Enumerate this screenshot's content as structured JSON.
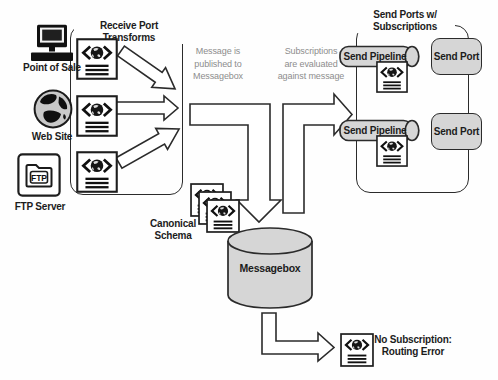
{
  "sources": [
    {
      "label": "Point of Sale"
    },
    {
      "label": "Web Site"
    },
    {
      "label": "FTP Server",
      "icon_text": "FTP"
    }
  ],
  "receive_group": {
    "title": "Receive Port Transforms"
  },
  "flow_notes": {
    "publish": "Message is\npublished to\nMessagebox",
    "subscriptions": "Subscriptions\nare evaluated\nagainst message"
  },
  "canonical_schema": {
    "label": "Canonical\nSchema"
  },
  "messagebox": {
    "label": "Messagebox"
  },
  "send_group": {
    "title": "Send Ports w/\nSubscriptions",
    "pipelines": [
      "Send Pipeline",
      "Send Pipeline"
    ],
    "ports": [
      "Send Port",
      "Send Port"
    ]
  },
  "routing_error": {
    "label": "No Subscription:\nRouting Error"
  },
  "colors": {
    "shape_fill": "#d6d6d6",
    "stroke": "#2b2b2b",
    "note_text": "#8d8d8d",
    "label_text": "#1c1c1c",
    "background": "#fefefe"
  }
}
